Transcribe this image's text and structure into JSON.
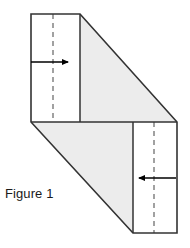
{
  "figure": {
    "caption": "Figure 1",
    "caption_x": 5,
    "caption_y": 198,
    "background_color": "#ffffff",
    "outline_color": "#333333",
    "shade_color": "#ececec",
    "panel_fill_color": "#ffffff",
    "dash_color": "#8a8a8a",
    "arrow_color": "#000000",
    "canvas": {
      "width": 190,
      "height": 248
    }
  },
  "shape": {
    "name": "z-fold-sheet",
    "description": "Z-shaped folded sheet with two flat end panels and two shaded diagonal bevel faces",
    "outline_points": "31,14 80,14 177,122 177,233 133,233 31,122",
    "upper_panel": {
      "x": 31,
      "y": 14,
      "width": 49,
      "height": 108
    },
    "lower_panel": {
      "x": 133,
      "y": 122,
      "width": 44,
      "height": 111
    },
    "upper_bevel_points": "80,14 177,122 80,122",
    "lower_bevel_points": "31,122 133,233 133,122",
    "mid_edge": {
      "x1": 31,
      "y1": 122,
      "x2": 177,
      "y2": 122
    },
    "upper_panel_right_edge": {
      "x1": 80,
      "y1": 14,
      "x2": 80,
      "y2": 122
    },
    "lower_panel_left_edge": {
      "x1": 133,
      "y1": 122,
      "x2": 133,
      "y2": 233
    }
  },
  "fold_lines": [
    {
      "id": "upper-fold-line",
      "label": "upper dashed fold line",
      "x": 53,
      "y1": 14,
      "y2": 122,
      "dash_pattern": "5,4"
    },
    {
      "id": "lower-fold-line",
      "label": "lower dashed fold line",
      "x": 154,
      "y1": 122,
      "y2": 233,
      "dash_pattern": "5,4"
    }
  ],
  "arrows": [
    {
      "id": "upper-arrow",
      "label": "upper arrow pointing right",
      "direction": "right",
      "x1": 31,
      "x2": 68,
      "y": 62
    },
    {
      "id": "lower-arrow",
      "label": "lower arrow pointing left",
      "direction": "left",
      "x1": 176,
      "x2": 139,
      "y": 178
    }
  ]
}
